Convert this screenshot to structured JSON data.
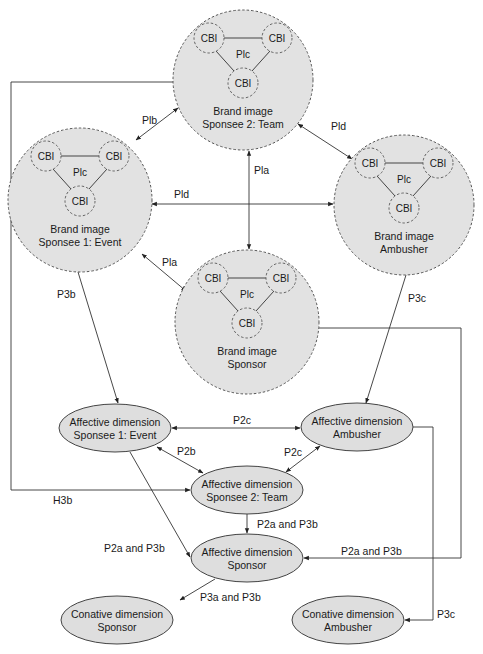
{
  "brand_images": [
    {
      "id": "team",
      "cx": 243,
      "cy": 80,
      "r": 70,
      "line1": "Brand image",
      "line2": "Sponsee 2: Team"
    },
    {
      "id": "event",
      "cx": 80,
      "cy": 200,
      "r": 72,
      "line1": "Brand image",
      "line2": "Sponsee 1: Event"
    },
    {
      "id": "ambusher",
      "cx": 404,
      "cy": 205,
      "r": 70,
      "line1": "Brand image",
      "line2": "Ambusher"
    },
    {
      "id": "sponsor",
      "cx": 247,
      "cy": 322,
      "r": 72,
      "line1": "Brand image",
      "line2": "Sponsor"
    }
  ],
  "cbi_label": "CBI",
  "plc_label": "Plc",
  "affective_nodes": [
    {
      "id": "aff-event",
      "cx": 115,
      "cy": 428,
      "rx": 56,
      "ry": 24,
      "line1": "Affective dimension",
      "line2": "Sponsee 1: Event"
    },
    {
      "id": "aff-ambusher",
      "cx": 357,
      "cy": 427,
      "rx": 56,
      "ry": 24,
      "line1": "Affective dimension",
      "line2": "Ambusher"
    },
    {
      "id": "aff-team",
      "cx": 247,
      "cy": 490,
      "rx": 56,
      "ry": 24,
      "line1": "Affective dimension",
      "line2": "Sponsee 2: Team"
    },
    {
      "id": "aff-sponsor",
      "cx": 247,
      "cy": 558,
      "rx": 56,
      "ry": 24,
      "line1": "Affective dimension",
      "line2": "Sponsor"
    }
  ],
  "conative_nodes": [
    {
      "id": "con-sponsor",
      "cx": 117,
      "cy": 620,
      "rx": 56,
      "ry": 24,
      "line1": "Conative dimension",
      "line2": "Sponsor"
    },
    {
      "id": "con-ambusher",
      "cx": 348,
      "cy": 620,
      "rx": 56,
      "ry": 24,
      "line1": "Conative dimension",
      "line2": "Ambusher"
    }
  ],
  "edge_labels": {
    "plb": "Plb",
    "pld_top": "Pld",
    "pld_mid": "Pld",
    "pla_vert": "Pla",
    "pla_diag": "Pla",
    "p3b_left": "P3b",
    "p3c_right": "P3c",
    "p2c_top": "P2c",
    "p2b": "P2b",
    "p2c_mid": "P2c",
    "h3b": "H3b",
    "p2a_p3b_center": "P2a and P3b",
    "p2a_p3b_left": "P2a and P3b",
    "p2a_p3b_right": "P2a and P3b",
    "p3a_p3b": "P3a and P3b",
    "p3c_bottom": "P3c"
  },
  "colors": {
    "node_fill": "#e2e2e2",
    "stroke": "#333333",
    "background": "#ffffff"
  }
}
